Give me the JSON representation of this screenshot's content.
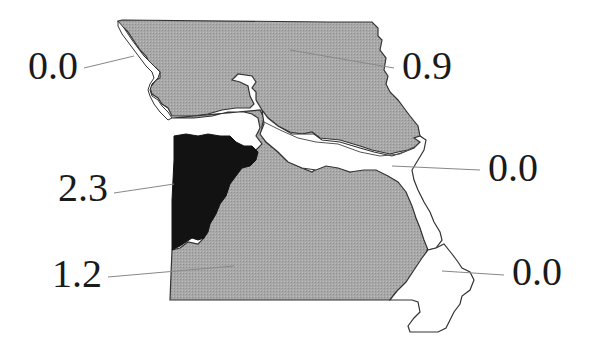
{
  "map": {
    "subject": "Missouri regions",
    "colors": {
      "low_fill": "#a8a8a8",
      "high_fill": "#121212",
      "zero_fill": "#ffffff",
      "outline": "#333333",
      "leader_line": "#888888"
    },
    "regions": [
      {
        "id": "northwest-river-strip",
        "value": "0.0",
        "fill": "zero"
      },
      {
        "id": "north",
        "value": "0.9",
        "fill": "low"
      },
      {
        "id": "kansas-city-west-central",
        "value": "2.3",
        "fill": "high"
      },
      {
        "id": "southwest-central-south",
        "value": "1.2",
        "fill": "low"
      },
      {
        "id": "east-central-st-louis",
        "value": "0.0",
        "fill": "zero"
      },
      {
        "id": "southeast-bootheel",
        "value": "0.0",
        "fill": "zero"
      }
    ]
  }
}
